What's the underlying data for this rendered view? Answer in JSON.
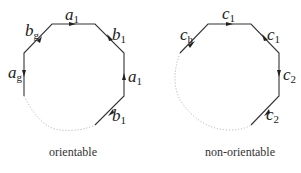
{
  "figure": {
    "left_polygon": {
      "caption": "orientable",
      "edges": [
        {
          "label": "a",
          "sub": "1",
          "position": "top"
        },
        {
          "label": "b",
          "sub": "1",
          "position": "top-right"
        },
        {
          "label": "a",
          "sub": "1",
          "position": "right"
        },
        {
          "label": "b",
          "sub": "1",
          "position": "bottom-right"
        },
        {
          "label": "a",
          "sub": "g",
          "position": "left"
        },
        {
          "label": "b",
          "sub": "g",
          "position": "top-left"
        }
      ]
    },
    "right_polygon": {
      "caption": "non-orientable",
      "edges": [
        {
          "label": "c",
          "sub": "1",
          "position": "top"
        },
        {
          "label": "c",
          "sub": "1",
          "position": "top-right"
        },
        {
          "label": "c",
          "sub": "2",
          "position": "right"
        },
        {
          "label": "c",
          "sub": "2",
          "position": "bottom-right"
        },
        {
          "label": "c",
          "sub": "h",
          "position": "top-left"
        }
      ]
    }
  }
}
